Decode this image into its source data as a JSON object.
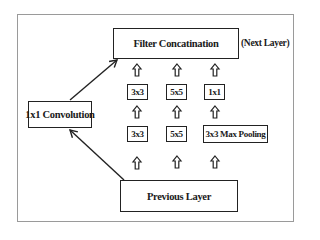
{
  "diagram": {
    "output_node": {
      "label": "Filter Concatination",
      "annotation": "(Next Layer)"
    },
    "input_node": {
      "label": "Previous Layer"
    },
    "side_branch": {
      "label": "1x1 Convolution"
    },
    "branches": [
      {
        "top": "3x3",
        "bottom": "3x3"
      },
      {
        "top": "5x5",
        "bottom": "5x5"
      },
      {
        "top": "1x1",
        "bottom": "3x3 Max Pooling"
      }
    ],
    "edges": [
      {
        "from": "Previous Layer",
        "to": "3x3 (bottom)"
      },
      {
        "from": "Previous Layer",
        "to": "5x5 (bottom)"
      },
      {
        "from": "Previous Layer",
        "to": "3x3 Max Pooling"
      },
      {
        "from": "3x3 (bottom)",
        "to": "3x3 (top)"
      },
      {
        "from": "5x5 (bottom)",
        "to": "5x5 (top)"
      },
      {
        "from": "3x3 Max Pooling",
        "to": "1x1"
      },
      {
        "from": "3x3 (top)",
        "to": "Filter Concatination"
      },
      {
        "from": "5x5 (top)",
        "to": "Filter Concatination"
      },
      {
        "from": "1x1",
        "to": "Filter Concatination"
      },
      {
        "from": "Previous Layer",
        "to": "1x1 Convolution"
      },
      {
        "from": "1x1 Convolution",
        "to": "Filter Concatination"
      }
    ]
  }
}
